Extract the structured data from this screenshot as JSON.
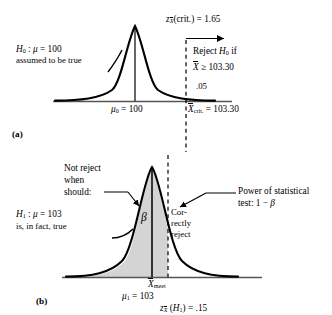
{
  "figure": {
    "panel_a_label": "(a)",
    "panel_b_label": "(b)"
  },
  "panel_a": {
    "hypothesis_line1": "H0 : μ = 100",
    "hypothesis_line2": "assumed to be true",
    "zcrit_label": "z",
    "zcrit_sub": "X",
    "zcrit_text": "(crit.) = 1.65",
    "reject_line1_a": "Reject ",
    "reject_line1_b": "H0",
    "reject_line1_c": " if",
    "reject_line2_a": "X",
    "reject_line2_b": " ≥ 103.30",
    "alpha_label": ".05",
    "mu0_label": "μ0 = 100",
    "xcrit_label_main": "X",
    "xcrit_label_sub": "crit.",
    "xcrit_label_value": " = 103.30"
  },
  "panel_b": {
    "not_reject_line1": "Not reject",
    "not_reject_line2": "when",
    "not_reject_line3": "should:",
    "hypothesis_line1": "H1 : μ = 103",
    "hypothesis_line2": "is, in fact, true",
    "beta_symbol": "β",
    "correctly_line1": "Cor-",
    "correctly_line2": "rectly",
    "correctly_line3": "reject",
    "power_line1": "Power of statistical",
    "power_line2": "test: 1 − β",
    "xmeet_main": "X",
    "xmeet_sub": "meet",
    "mu1_label": "μ1 = 103",
    "z_h1_main": "z",
    "z_h1_sub": "X",
    "z_h1_text": "(H1) = .15"
  },
  "colors": {
    "curve": "#000000",
    "shade": "#d4d4d4",
    "axis": "#555555",
    "dashed": "#000000"
  }
}
